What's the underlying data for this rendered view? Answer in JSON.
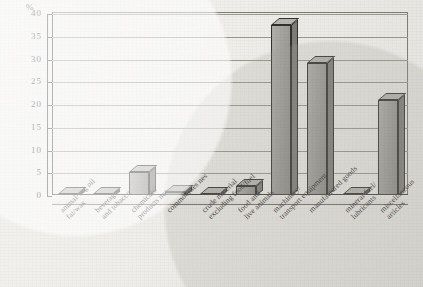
{
  "chart_data": {
    "type": "bar",
    "title": "",
    "subtitle": "",
    "xlabel": "",
    "ylabel": "%",
    "ylim": [
      0,
      40
    ],
    "ytick_labels": [
      "40",
      "35",
      "30",
      "25",
      "20",
      "15",
      "10",
      "5",
      "0"
    ],
    "ytick_values": [
      40,
      35,
      30,
      25,
      20,
      15,
      10,
      5,
      0
    ],
    "grid": true,
    "legend": "none",
    "style": "3d-columns-scanned",
    "categories": [
      "animal/veg oil fat/wax",
      "beverages and tobacco",
      "chemicals/products nes commodities nes",
      "commodities nes",
      "crude material excluding food/fuel",
      "food and live animals",
      "machinery/transport equipment",
      "manufactured goods",
      "mineral fuel/lubricants",
      "miscellaneous articles"
    ],
    "category_lines": [
      [
        "animal/veg oil",
        "fat/wax"
      ],
      [
        "beverages",
        "and tobacco"
      ],
      [
        "chemicals/",
        "products nes"
      ],
      [
        "commodities nes"
      ],
      [
        "crude material",
        "excluding food/fuel"
      ],
      [
        "food and",
        "live animals"
      ],
      [
        "machinery/",
        "transport equipment"
      ],
      [
        "manufactured goods"
      ],
      [
        "mineral fuel/",
        "lubricants"
      ],
      [
        "miscellaneous",
        "articles"
      ]
    ],
    "values": [
      0.3,
      0.3,
      5.2,
      0.8,
      0.5,
      2.2,
      37.6,
      29.2,
      0.3,
      21.0
    ]
  },
  "colors": {
    "bar_face": "#9c9a94",
    "bar_side": "#7e7c76",
    "bar_top": "#b9b7b0",
    "outline": "#2e2e2c",
    "grid": "#9a988f",
    "paper": "#efeeea",
    "text": "#2b2b2b"
  }
}
